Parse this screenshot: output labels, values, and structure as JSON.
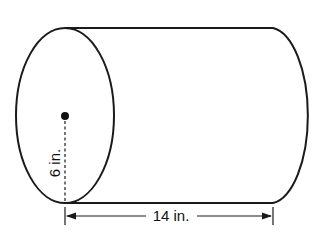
{
  "diagram": {
    "shape": "cylinder",
    "radius_label": "6 in.",
    "length_label": "14 in.",
    "colors": {
      "stroke": "#1a1a1a",
      "background": "#ffffff"
    }
  }
}
